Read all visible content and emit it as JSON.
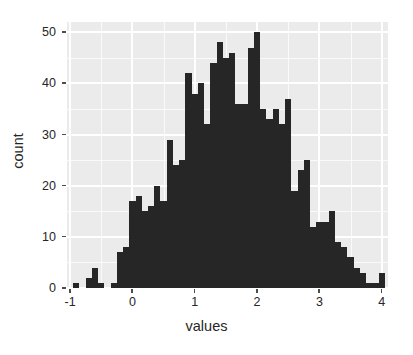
{
  "chart_data": {
    "type": "bar",
    "subtype": "histogram",
    "title": "",
    "xlabel": "values",
    "ylabel": "count",
    "xlim": [
      -1.05,
      4.1
    ],
    "ylim": [
      0,
      52
    ],
    "xticks": [
      -1,
      0,
      1,
      2,
      3,
      4
    ],
    "xticklabels": [
      "-1",
      "0",
      "1",
      "2",
      "3",
      "4"
    ],
    "yticks": [
      0,
      10,
      20,
      30,
      40,
      50
    ],
    "yticklabels": [
      "0",
      "10",
      "20",
      "30",
      "40",
      "50"
    ],
    "grid": true,
    "grid_major_color": "#FFFFFF",
    "panel_color": "#EBEBEB",
    "bar_color": "#262626",
    "legend": "none",
    "binwidth": 0.1,
    "bin_left_edges": [
      -0.95,
      -0.85,
      -0.75,
      -0.65,
      -0.55,
      -0.45,
      -0.35,
      -0.25,
      -0.15,
      -0.05,
      0.05,
      0.15,
      0.25,
      0.35,
      0.45,
      0.55,
      0.65,
      0.75,
      0.85,
      0.95,
      1.05,
      1.15,
      1.25,
      1.35,
      1.45,
      1.55,
      1.65,
      1.75,
      1.85,
      1.95,
      2.05,
      2.15,
      2.25,
      2.35,
      2.45,
      2.55,
      2.65,
      2.75,
      2.85,
      2.95,
      3.05,
      3.15,
      3.25,
      3.35,
      3.45,
      3.55,
      3.65,
      3.75,
      3.85,
      3.95
    ],
    "bin_centers": [
      -0.9,
      -0.8,
      -0.7,
      -0.6,
      -0.5,
      -0.4,
      -0.3,
      -0.2,
      -0.1,
      0.0,
      0.1,
      0.2,
      0.3,
      0.4,
      0.5,
      0.6,
      0.7,
      0.8,
      0.9,
      1.0,
      1.1,
      1.2,
      1.3,
      1.4,
      1.5,
      1.6,
      1.7,
      1.8,
      1.9,
      2.0,
      2.1,
      2.2,
      2.3,
      2.4,
      2.5,
      2.6,
      2.7,
      2.8,
      2.9,
      3.0,
      3.1,
      3.2,
      3.3,
      3.4,
      3.5,
      3.6,
      3.7,
      3.8,
      3.9,
      4.0
    ],
    "counts": [
      1,
      0,
      2,
      4,
      1,
      0,
      1,
      7,
      8,
      17,
      18,
      15,
      16,
      20,
      17,
      29,
      24,
      25,
      42,
      38,
      40,
      32,
      44,
      48,
      45,
      46,
      36,
      36,
      47,
      50,
      35,
      33,
      35,
      32,
      37,
      19,
      23,
      25,
      12,
      13,
      13,
      15,
      9,
      8,
      6,
      4,
      3,
      1,
      1,
      3
    ],
    "values": [
      1,
      0,
      2,
      4,
      1,
      0,
      1,
      7,
      8,
      17,
      18,
      15,
      16,
      20,
      17,
      29,
      24,
      25,
      42,
      38,
      40,
      32,
      44,
      48,
      45,
      46,
      36,
      36,
      47,
      50,
      35,
      33,
      35,
      32,
      37,
      19,
      23,
      25,
      12,
      13,
      13,
      15,
      9,
      8,
      6,
      4,
      3,
      1,
      1,
      3
    ],
    "categories": [
      "-0.9",
      "-0.8",
      "-0.7",
      "-0.6",
      "-0.5",
      "-0.4",
      "-0.3",
      "-0.2",
      "-0.1",
      "0.0",
      "0.1",
      "0.2",
      "0.3",
      "0.4",
      "0.5",
      "0.6",
      "0.7",
      "0.8",
      "0.9",
      "1.0",
      "1.1",
      "1.2",
      "1.3",
      "1.4",
      "1.5",
      "1.6",
      "1.7",
      "1.8",
      "1.9",
      "2.0",
      "2.1",
      "2.2",
      "2.3",
      "2.4",
      "2.5",
      "2.6",
      "2.7",
      "2.8",
      "2.9",
      "3.0",
      "3.1",
      "3.2",
      "3.3",
      "3.4",
      "3.5",
      "3.6",
      "3.7",
      "3.8",
      "3.9",
      "4.0"
    ],
    "max_count": 50,
    "total_count": 1000
  }
}
